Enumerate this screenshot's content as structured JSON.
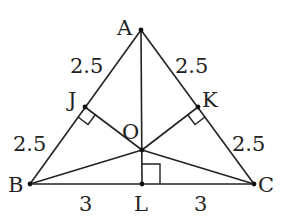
{
  "diagram": {
    "type": "triangle-geometry",
    "colors": {
      "stroke": "#222222",
      "background": "#ffffff"
    },
    "points": {
      "A": {
        "label": "A",
        "x": 141,
        "y": 30
      },
      "B": {
        "label": "B",
        "x": 30,
        "y": 184
      },
      "C": {
        "label": "C",
        "x": 254,
        "y": 184
      },
      "J": {
        "label": "J",
        "x": 85,
        "y": 107
      },
      "K": {
        "label": "K",
        "x": 198,
        "y": 107
      },
      "O": {
        "label": "O",
        "x": 142,
        "y": 150
      },
      "L": {
        "label": "L",
        "x": 142,
        "y": 184
      }
    },
    "segment_labels": {
      "AJ": "2.5",
      "JB": "2.5",
      "AK": "2.5",
      "KC": "2.5",
      "BL": "3",
      "LC": "3"
    },
    "right_angles": [
      "J",
      "K",
      "L"
    ]
  }
}
